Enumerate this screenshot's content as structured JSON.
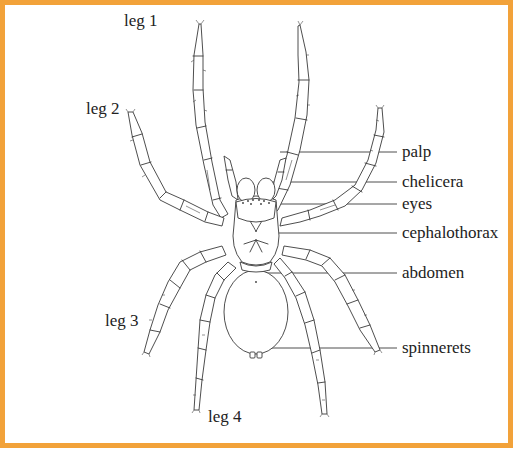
{
  "figure": {
    "frame_color": "#f2a23a",
    "line_color": "#3a3a3a",
    "text_color": "#222222"
  },
  "leg_labels": [
    {
      "id": "leg1",
      "text": "leg 1",
      "x": 124,
      "y": 18
    },
    {
      "id": "leg2",
      "text": "leg 2",
      "x": 86,
      "y": 106
    },
    {
      "id": "leg3",
      "text": "leg 3",
      "x": 105,
      "y": 318
    },
    {
      "id": "leg4",
      "text": "leg 4",
      "x": 208,
      "y": 414
    }
  ],
  "part_labels": [
    {
      "id": "palp",
      "text": "palp",
      "y": 152
    },
    {
      "id": "chelicera",
      "text": "chelicera",
      "y": 182
    },
    {
      "id": "eyes",
      "text": "eyes",
      "y": 204
    },
    {
      "id": "cephalothorax",
      "text": "cephalothorax",
      "y": 233
    },
    {
      "id": "abdomen",
      "text": "abdomen",
      "y": 273
    },
    {
      "id": "spinnerets",
      "text": "spinnerets",
      "y": 348
    }
  ]
}
